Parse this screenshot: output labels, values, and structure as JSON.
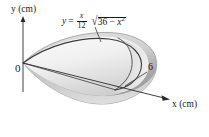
{
  "figure": {
    "kind": "solid-of-revolution-diagram",
    "axes": {
      "y_axis_label": "y (cm)",
      "x_axis_label": "x (cm)",
      "origin_label": "0"
    },
    "annotations": {
      "x_intercept_label": "6",
      "equation": {
        "lhs": "y",
        "equals": "=",
        "coefficient_numerator": "x",
        "coefficient_denominator": "12",
        "radical_sign": "√",
        "radicand_constant": "36",
        "radicand_minus": "−",
        "radicand_variable": "x",
        "radicand_exponent": "2",
        "plain_text": "y = (x/12)√(36 − x²)"
      }
    },
    "colors": {
      "background": "#ffffff",
      "ink": "#1a1a1a",
      "solid_fill_light": "#f2f2f2",
      "solid_fill_mid": "#d8d8d8",
      "solid_fill_dark": "#a8a8a8",
      "outline": "#6d6d6d",
      "curve_stroke": "#3a3a3a"
    }
  }
}
